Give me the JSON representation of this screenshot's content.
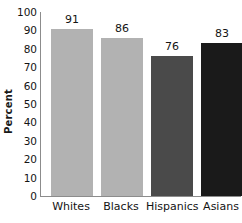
{
  "chart_data": {
    "type": "bar",
    "title": "",
    "subtitle": "",
    "xlabel": "",
    "ylabel": "Percent",
    "categories": [
      "Whites",
      "Blacks",
      "Hispanics",
      "Asians"
    ],
    "values": [
      91,
      86,
      76,
      83
    ],
    "value_labels": [
      "91",
      "86",
      "76",
      "83"
    ],
    "bar_colors": [
      "#b2b2b2",
      "#b2b2b2",
      "#4a4a4a",
      "#1a1a1a"
    ],
    "ylim": [
      0,
      100
    ],
    "ytick_step": 10,
    "ytick_labels": [
      "100",
      "90",
      "80",
      "70",
      "60",
      "50",
      "40",
      "30",
      "20",
      "10",
      "0"
    ],
    "ytick_values": [
      100,
      90,
      80,
      70,
      60,
      50,
      40,
      30,
      20,
      10,
      0
    ],
    "grid": false,
    "legend": null,
    "annotations": [],
    "axis_color": "#8c8c8c",
    "text_color": "#141414",
    "background": "#ffffff"
  }
}
